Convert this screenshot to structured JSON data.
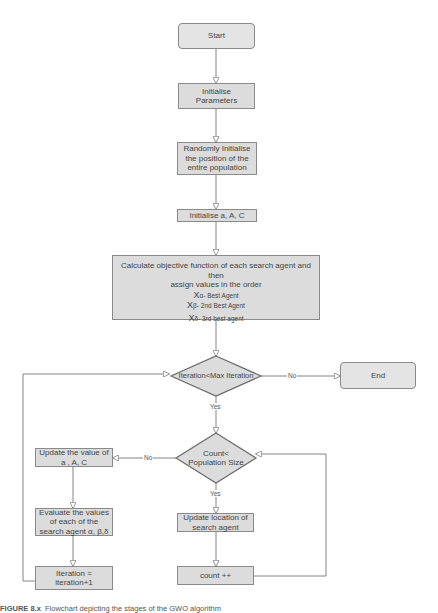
{
  "diagram": {
    "type": "flowchart",
    "colors": {
      "fill": "#dcdcdc",
      "stroke": "#8a8a8a",
      "line": "#777777",
      "text": "#444444"
    },
    "nodes": {
      "start": {
        "label": "Start",
        "shape": "rounded-rect"
      },
      "init_params": {
        "label": "Initialise Parameters",
        "shape": "rect"
      },
      "random_init": {
        "label": "Randomly Initialise the position of the entire population",
        "shape": "rect"
      },
      "init_aAC": {
        "label": "Initialise a, A, C",
        "shape": "rect"
      },
      "calculate": {
        "shape": "rect",
        "line1": "Calculate objective function of each search agent and then",
        "line2": "assign values in the order",
        "agents": [
          {
            "symbol": "X",
            "sub": "α- Best Agent"
          },
          {
            "symbol": "X",
            "sub": "β- 2nd Best Agent"
          },
          {
            "symbol": "X",
            "sub": "δ- 3rd best agent"
          }
        ]
      },
      "iter_check": {
        "label": "Iteration<Max Iteration",
        "shape": "diamond"
      },
      "end": {
        "label": "End",
        "shape": "rounded-rect"
      },
      "count_check": {
        "label": "Count< Population Size",
        "shape": "diamond"
      },
      "update_aAC": {
        "label": "Update the value of a , A, C",
        "shape": "rect"
      },
      "evaluate": {
        "label": "Evaluate the values of each of the search agent α, β,δ",
        "shape": "rect"
      },
      "update_location": {
        "label": "Update location of search agent",
        "shape": "rect"
      },
      "iter_inc": {
        "label": "Iteration = iteration+1",
        "shape": "rect"
      },
      "count_inc": {
        "label": "count ++",
        "shape": "rect"
      }
    },
    "edge_labels": {
      "iter_no": "No",
      "iter_yes": "Yes",
      "count_no": "No",
      "count_yes": "Yes"
    },
    "edges": [
      [
        "start",
        "init_params"
      ],
      [
        "init_params",
        "random_init"
      ],
      [
        "random_init",
        "init_aAC"
      ],
      [
        "init_aAC",
        "calculate"
      ],
      [
        "calculate",
        "iter_check"
      ],
      [
        "iter_check",
        "end",
        "No"
      ],
      [
        "iter_check",
        "count_check",
        "Yes"
      ],
      [
        "count_check",
        "update_aAC",
        "No"
      ],
      [
        "count_check",
        "update_location",
        "Yes"
      ],
      [
        "update_location",
        "count_inc"
      ],
      [
        "count_inc",
        "count_check"
      ],
      [
        "update_aAC",
        "evaluate"
      ],
      [
        "evaluate",
        "iter_inc"
      ],
      [
        "iter_inc",
        "iter_check"
      ]
    ]
  },
  "caption": {
    "prefix": "FIGURE 8.x",
    "text": "Flowchart depicting the stages of the GWO algorithm"
  }
}
